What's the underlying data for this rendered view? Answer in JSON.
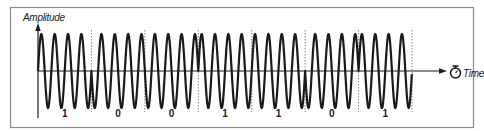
{
  "diagram": {
    "y_axis_label": "Amplitude",
    "x_axis_label": "Time",
    "time_icon": "stopwatch-icon",
    "bits": [
      "1",
      "0",
      "0",
      "1",
      "1",
      "0",
      "1"
    ],
    "cycles_per_bit": 4,
    "phase_for_bit": {
      "1": 0,
      "0": 180
    },
    "colors": {
      "wave": "#1a1a1a",
      "frame": "#8a8a8a",
      "divider": "#777777",
      "background": "#ffffff"
    }
  },
  "chart_data": {
    "type": "line",
    "title": "",
    "xlabel": "Time",
    "ylabel": "Amplitude",
    "categories": [
      "1",
      "0",
      "0",
      "1",
      "1",
      "0",
      "1"
    ],
    "series": [
      {
        "name": "carrier",
        "description": "Sinusoidal carrier, 4 cycles per bit period; phase shifted 180° for bit 0 relative to bit 1",
        "bits": [
          1,
          0,
          0,
          1,
          1,
          0,
          1
        ],
        "cycles_per_bit": 4
      }
    ],
    "grid": false,
    "bit_dividers": true,
    "legend": "none"
  }
}
